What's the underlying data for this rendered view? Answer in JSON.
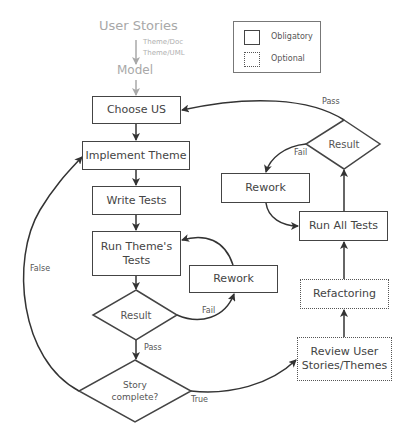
{
  "header": {
    "user_stories": "User Stories",
    "theme_doc": "Theme/Doc",
    "theme_uml": "Theme/UML",
    "model": "Model"
  },
  "legend": {
    "obligatory": "Obligatory",
    "optional": "Optional"
  },
  "nodes": {
    "choose_us": "Choose US",
    "implement_theme": "Implement Theme",
    "write_tests": "Write Tests",
    "run_theme_tests_line1": "Run Theme's",
    "run_theme_tests_line2": "Tests",
    "rework_lower": "Rework",
    "result_lower": "Result",
    "story_complete_line1": "Story",
    "story_complete_line2": "complete?",
    "review_line1": "Review User",
    "review_line2": "Stories/Themes",
    "refactoring": "Refactoring",
    "run_all_tests": "Run All Tests",
    "rework_upper": "Rework",
    "result_upper": "Result"
  },
  "edge_labels": {
    "pass_top": "Pass",
    "fail_upper": "Fail",
    "fail_lower": "Fail",
    "pass_lower": "Pass",
    "false": "False",
    "true": "True"
  },
  "colors": {
    "stroke": "#444444",
    "muted": "#a8a8a8"
  }
}
